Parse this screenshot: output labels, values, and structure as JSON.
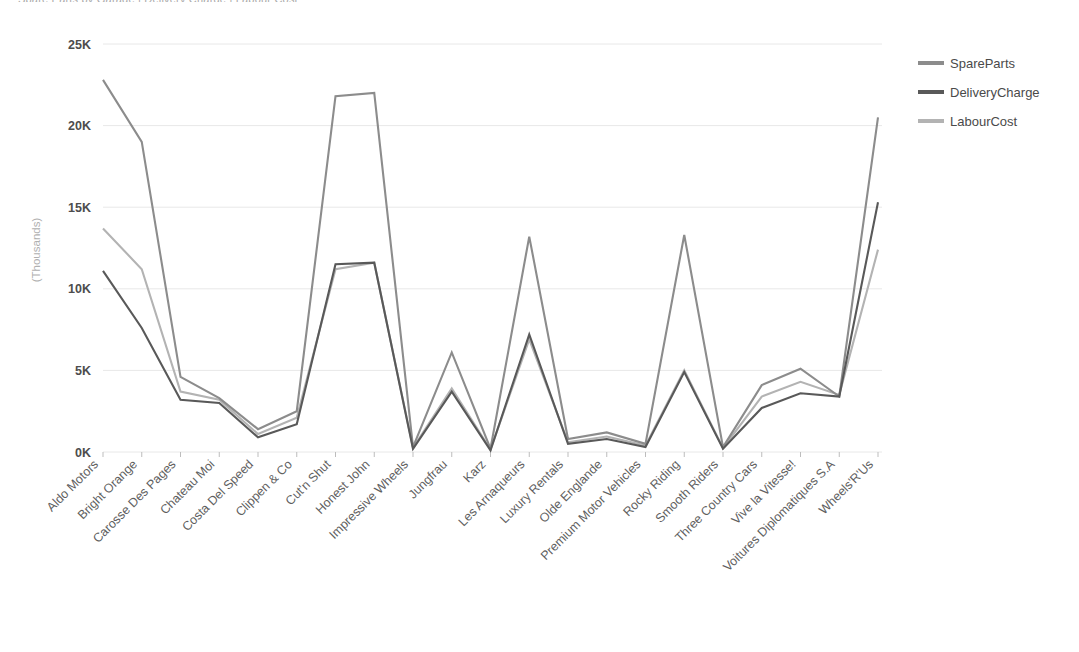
{
  "clipped_header_text": "Spare Parts by Garage  |  Delivery Charge  |  Labour Cost",
  "chart_data": {
    "type": "line",
    "title": "",
    "xlabel": "",
    "ylabel": "(Thousands)",
    "ylim": [
      0,
      25000
    ],
    "ytick_labels": [
      "0K",
      "5K",
      "10K",
      "15K",
      "20K",
      "25K"
    ],
    "ytick_values": [
      0,
      5000,
      10000,
      15000,
      20000,
      25000
    ],
    "grid": true,
    "legend_position": "right",
    "categories": [
      "Aldo Motors",
      "Bright Orange",
      "Carosse Des Pages",
      "Chateau Moi",
      "Costa Del Speed",
      "Clippen & Co",
      "Cut'n Shut",
      "Honest John",
      "Impressive Wheels",
      "Jungfrau",
      "Karz",
      "Les Arnaqueurs",
      "Luxury Rentals",
      "Olde Englande",
      "Premium Motor Vehicles",
      "Rocky Riding",
      "Smooth Riders",
      "Three Country Cars",
      "Vive la Vitesse!",
      "Voitures Diplomatiques S.A",
      "Wheels'R'Us"
    ],
    "series": [
      {
        "name": "SpareParts",
        "color": "#8c8c8c",
        "values": [
          22800,
          19000,
          4600,
          3300,
          1400,
          2500,
          21800,
          22000,
          300,
          6100,
          200,
          13200,
          800,
          1200,
          500,
          13300,
          300,
          4100,
          5100,
          3400,
          20500
        ]
      },
      {
        "name": "DeliveryCharge",
        "color": "#595959",
        "values": [
          11100,
          7600,
          3200,
          3000,
          900,
          1700,
          11500,
          11600,
          200,
          3700,
          100,
          7200,
          500,
          800,
          300,
          4900,
          200,
          2700,
          3600,
          3400,
          15300
        ]
      },
      {
        "name": "LabourCost",
        "color": "#b3b3b3",
        "values": [
          13700,
          11200,
          3700,
          3200,
          1100,
          2100,
          11200,
          11600,
          250,
          3900,
          150,
          6900,
          600,
          950,
          400,
          5000,
          250,
          3400,
          4300,
          3500,
          12400
        ]
      }
    ]
  },
  "legend": {
    "items": [
      {
        "label": "SpareParts"
      },
      {
        "label": "DeliveryCharge"
      },
      {
        "label": "LabourCost"
      }
    ]
  }
}
